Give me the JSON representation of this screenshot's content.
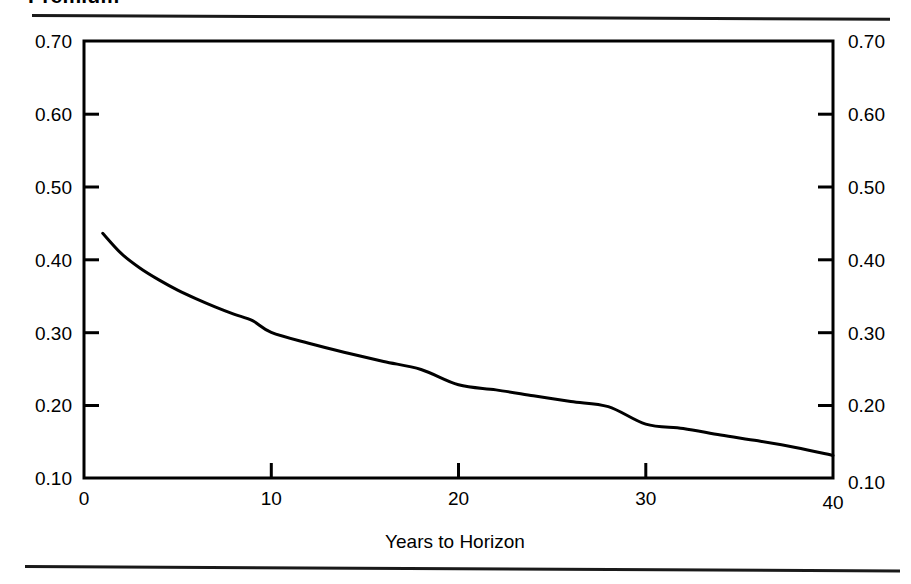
{
  "title": "Premium",
  "axis_bottom_label": "Years to Horizon",
  "y_ticks_left": [
    "0.70",
    "0.60",
    "0.50",
    "0.40",
    "0.30",
    "0.20",
    "0.10"
  ],
  "y_ticks_right": [
    "0.70",
    "0.60",
    "0.50",
    "0.40",
    "0.30",
    "0.20",
    "0.10"
  ],
  "x_ticks": [
    "0",
    "10",
    "20",
    "30",
    "40"
  ],
  "colors": {
    "line": "#000000",
    "frame": "#000000",
    "background": "#ffffff",
    "rule": "#1a1a1a"
  },
  "chart_data": {
    "type": "line",
    "title": "Premium",
    "xlabel": "Years to Horizon",
    "ylabel": "",
    "xlim": [
      0,
      40
    ],
    "ylim": [
      0.1,
      0.7
    ],
    "xticks": [
      0,
      10,
      20,
      30,
      40
    ],
    "yticks": [
      0.1,
      0.2,
      0.3,
      0.4,
      0.5,
      0.6,
      0.7
    ],
    "grid": false,
    "legend": false,
    "dual_y_axis": true,
    "series": [
      {
        "name": "Premium",
        "x": [
          1,
          2,
          3,
          4,
          5,
          6,
          7,
          8,
          9,
          10,
          12,
          14,
          16,
          18,
          20,
          22,
          24,
          26,
          28,
          30,
          32,
          34,
          36,
          38,
          40
        ],
        "values": [
          0.436,
          0.408,
          0.388,
          0.372,
          0.358,
          0.346,
          0.335,
          0.325,
          0.316,
          0.3,
          0.285,
          0.272,
          0.26,
          0.249,
          0.228,
          0.221,
          0.213,
          0.205,
          0.198,
          0.174,
          0.168,
          0.159,
          0.151,
          0.142,
          0.131
        ]
      }
    ]
  }
}
